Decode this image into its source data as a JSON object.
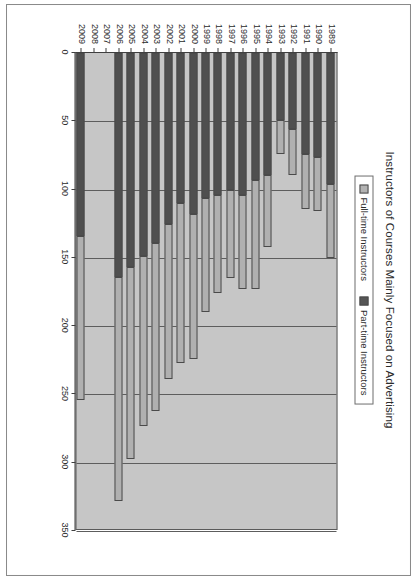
{
  "chart_data": {
    "type": "bar",
    "orientation": "horizontal",
    "stacked": true,
    "title": "Instructors of Courses Mainly Focused on Advertising",
    "xlabel": "",
    "ylabel": "",
    "xlim": [
      0,
      350
    ],
    "xticks": [
      0,
      50,
      100,
      150,
      200,
      250,
      300,
      350
    ],
    "xtick_labels": [
      "0",
      "50",
      "100",
      "150",
      "200",
      "250",
      "300",
      "350"
    ],
    "grid": true,
    "legend_position": "top-center",
    "legend": [
      "Full-time Instructors",
      "Part-time Instructors"
    ],
    "categories": [
      "1989",
      "1990",
      "1991",
      "1992",
      "1993",
      "1994",
      "1995",
      "1996",
      "1997",
      "1998",
      "1999",
      "2000",
      "2001",
      "2002",
      "2003",
      "2004",
      "2005",
      "2006",
      "2007",
      "2008",
      "2009"
    ],
    "series": [
      {
        "name": "Full-time Instructors",
        "color": "#b0b0b0",
        "values": [
          54,
          40,
          40,
          33,
          25,
          53,
          80,
          69,
          65,
          72,
          84,
          106,
          117,
          114,
          123,
          124,
          140,
          164,
          0,
          0,
          120
        ]
      },
      {
        "name": "Part-time Instructors",
        "color": "#4f4f4f",
        "values": [
          96,
          76,
          74,
          56,
          49,
          89,
          93,
          104,
          100,
          104,
          106,
          118,
          110,
          125,
          139,
          149,
          157,
          164,
          0,
          0,
          134
        ]
      }
    ],
    "totals": [
      150,
      116,
      114,
      89,
      74,
      142,
      173,
      173,
      165,
      176,
      190,
      224,
      227,
      239,
      262,
      273,
      297,
      328,
      0,
      0,
      254
    ]
  },
  "colors": {
    "plot_background": "#c6c6c6",
    "full_time": "#b0b0b0",
    "part_time": "#4f4f4f",
    "axis": "#3f3f3f",
    "text": "#2b2b2b"
  }
}
